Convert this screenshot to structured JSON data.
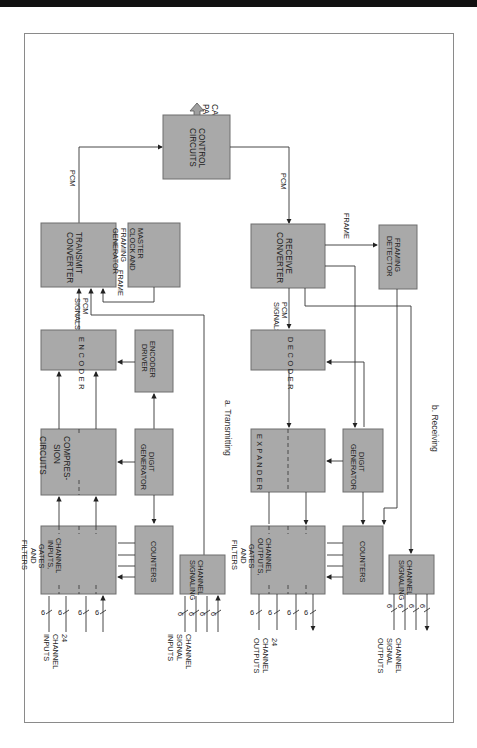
{
  "diagram": {
    "orientation": "rotated 90 degrees clockwise (read with page turned)",
    "colors": {
      "box_fill": "#a9a9a9",
      "box_stroke": "#6e6e6e",
      "line": "#333333",
      "frame": "#8a8a8a"
    },
    "shared": {
      "control_circuits": [
        "CONTROL",
        "CIRCUITS"
      ],
      "cable_pairs": [
        "CABLE",
        "PAIRS"
      ]
    },
    "transmitting": {
      "caption": "a. Transmitting",
      "transmit_converter": [
        "TRANSMIT",
        "CONVERTER"
      ],
      "master_clock": [
        "MASTER",
        "CLOCK AND",
        "FRAMING",
        "GENERATOR"
      ],
      "encoder": "ENCODER",
      "encoder_driver": [
        "ENCODER",
        "DRIVER"
      ],
      "compression": [
        "COMPRES-",
        "SION",
        "CIRCUITS"
      ],
      "digit_generator": [
        "DIGIT",
        "GENERATOR"
      ],
      "channel_inputs": [
        "CHANNEL",
        "INPUTS,",
        "GATES",
        "AND",
        "FILTERS"
      ],
      "counters": "COUNTERS",
      "channel_signaling": [
        "CHANNEL",
        "SIGNALING"
      ],
      "pcm_label": "PCM",
      "pcm_signals": [
        "PCM",
        "SIGNALS"
      ],
      "frame_label": "FRAME",
      "bus_width": "6",
      "inputs_label": [
        "24",
        "CHANNEL",
        "INPUTS"
      ],
      "signal_inputs_label": [
        "CHANNEL",
        "SIGNAL",
        "INPUTS"
      ]
    },
    "receiving": {
      "caption": "b. Receiving",
      "receive_converter": [
        "RECEIVE",
        "CONVERTER"
      ],
      "framing_detector": [
        "FRAMING",
        "DETECTOR"
      ],
      "decoder": "DECODER",
      "expander": "EXPANDER",
      "digit_generator": [
        "DIGIT",
        "GENERATOR"
      ],
      "channel_outputs": [
        "CHANNEL",
        "OUTPUTS,",
        "GATES",
        "AND",
        "FILTERS"
      ],
      "counters": "COUNTERS",
      "channel_signaling": [
        "CHANNEL",
        "SIGNALING"
      ],
      "pcm_label": "PCM",
      "pcm_signals": [
        "PCM",
        "SIGNALS"
      ],
      "frame_label": "FRAME",
      "bus_width": "6",
      "outputs_label": [
        "24",
        "CHANNEL",
        "OUTPUTS"
      ],
      "signal_outputs_label": [
        "CHANNEL",
        "SIGNAL",
        "OUTPUTS"
      ]
    }
  }
}
